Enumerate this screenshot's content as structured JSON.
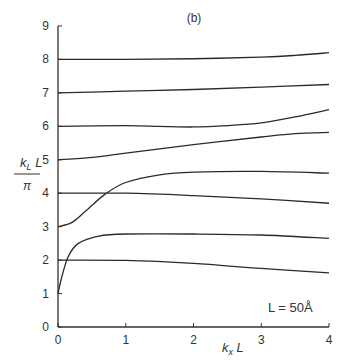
{
  "chart_data": {
    "type": "line",
    "title": "(b)",
    "xlabel": "k_x L",
    "ylabel": "k_L L / π",
    "xlim": [
      0,
      4
    ],
    "ylim": [
      0,
      9
    ],
    "x_ticks": [
      0,
      1,
      2,
      3,
      4
    ],
    "y_ticks": [
      0,
      1,
      2,
      3,
      4,
      5,
      6,
      7,
      8,
      9
    ],
    "grid": false,
    "annotation": "L = 50Å",
    "series": [
      {
        "name": "branch-8",
        "x": [
          0,
          1,
          2,
          3,
          3.5,
          4
        ],
        "y": [
          8.0,
          8.0,
          8.02,
          8.07,
          8.12,
          8.2
        ]
      },
      {
        "name": "branch-7",
        "x": [
          0,
          1,
          2,
          3,
          4
        ],
        "y": [
          7.0,
          7.05,
          7.1,
          7.17,
          7.25
        ]
      },
      {
        "name": "branch-6",
        "x": [
          0,
          1,
          1.5,
          2,
          2.5,
          3,
          3.5,
          4
        ],
        "y": [
          6.0,
          6.02,
          6.0,
          5.98,
          6.02,
          6.1,
          6.28,
          6.5
        ]
      },
      {
        "name": "branch-5",
        "x": [
          0,
          0.5,
          1,
          2,
          3,
          3.5,
          4
        ],
        "y": [
          5.0,
          5.07,
          5.2,
          5.45,
          5.68,
          5.78,
          5.82
        ]
      },
      {
        "name": "branch-3",
        "x": [
          0,
          0.2,
          0.4,
          0.7,
          1.0,
          1.5,
          2,
          3,
          4
        ],
        "y": [
          3.0,
          3.12,
          3.45,
          3.98,
          4.32,
          4.55,
          4.63,
          4.65,
          4.6
        ]
      },
      {
        "name": "branch-4",
        "x": [
          0,
          1,
          2,
          3,
          4
        ],
        "y": [
          4.0,
          4.0,
          3.93,
          3.83,
          3.7
        ]
      },
      {
        "name": "branch-1",
        "x": [
          0,
          0.05,
          0.15,
          0.3,
          0.6,
          1.0,
          2,
          3,
          4
        ],
        "y": [
          1.0,
          1.45,
          2.1,
          2.5,
          2.72,
          2.78,
          2.78,
          2.75,
          2.65
        ]
      },
      {
        "name": "branch-2",
        "x": [
          0,
          1,
          2,
          3,
          4
        ],
        "y": [
          2.0,
          1.99,
          1.9,
          1.75,
          1.62
        ]
      }
    ]
  }
}
